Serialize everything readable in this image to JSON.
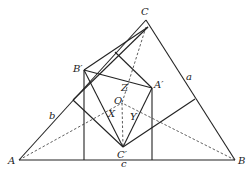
{
  "diagram": {
    "points": {
      "A": {
        "label": "A",
        "x": 19,
        "y": 160
      },
      "B": {
        "label": "B",
        "x": 235,
        "y": 160
      },
      "C": {
        "label": "C",
        "x": 146,
        "y": 20
      },
      "A_prime": {
        "label": "A′",
        "x": 152,
        "y": 88
      },
      "B_prime": {
        "label": "B′",
        "x": 84,
        "y": 70
      },
      "C_prime": {
        "label": "C′",
        "x": 123,
        "y": 147
      },
      "O": {
        "label": "O",
        "x": 122,
        "y": 103
      },
      "X": {
        "label": "X",
        "x": 112,
        "y": 112
      },
      "Y": {
        "label": "Y",
        "x": 133,
        "y": 113
      },
      "Z": {
        "label": "Z",
        "x": 126,
        "y": 86
      }
    },
    "side_labels": {
      "a": {
        "label": "a",
        "x": 188,
        "y": 80
      },
      "b": {
        "label": "b",
        "x": 50,
        "y": 118
      },
      "c": {
        "label": "c",
        "x": 122,
        "y": 165
      }
    },
    "solid_segments": [
      [
        19,
        160,
        235,
        160
      ],
      [
        19,
        160,
        146,
        20
      ],
      [
        146,
        20,
        235,
        160
      ],
      [
        84,
        70,
        148,
        27
      ],
      [
        84,
        70,
        152,
        88
      ],
      [
        84,
        70,
        123,
        147
      ],
      [
        84,
        70,
        84,
        160
      ],
      [
        152,
        88,
        123,
        147
      ],
      [
        152,
        88,
        152,
        160
      ],
      [
        152,
        88,
        115,
        52
      ],
      [
        148,
        27,
        73,
        100
      ],
      [
        73,
        100,
        123,
        147
      ],
      [
        123,
        147,
        195,
        99
      ]
    ],
    "dashed_segments": [
      [
        19,
        160,
        122,
        103
      ],
      [
        235,
        160,
        122,
        103
      ],
      [
        146,
        27,
        122,
        103
      ],
      [
        122,
        103,
        123,
        147
      ]
    ]
  }
}
